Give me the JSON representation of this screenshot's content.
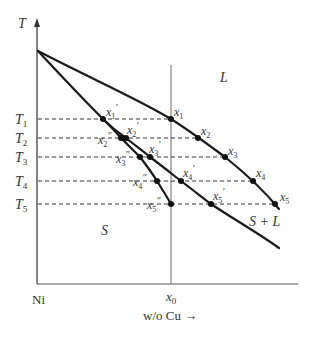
{
  "diagram": {
    "axes": {
      "y_label": "T",
      "x_origin_label": "Ni",
      "x_marker_label": "x",
      "x_marker_sub": "0",
      "x_axis_label": "w/o Cu →"
    },
    "regions": {
      "liquid": "L",
      "solid": "S",
      "two_phase": "S + L"
    },
    "temperatures": [
      {
        "label": "T",
        "sub": "1",
        "y": 119
      },
      {
        "label": "T",
        "sub": "2",
        "y": 138
      },
      {
        "label": "T",
        "sub": "3",
        "y": 157
      },
      {
        "label": "T",
        "sub": "4",
        "y": 181
      },
      {
        "label": "T",
        "sub": "5",
        "y": 204
      }
    ],
    "liquidus_points": [
      {
        "name": "x",
        "sub": "1",
        "prime": "",
        "x": 171,
        "y": 119
      },
      {
        "name": "x",
        "sub": "2",
        "prime": "",
        "x": 198,
        "y": 138
      },
      {
        "name": "x",
        "sub": "3",
        "prime": "",
        "x": 225,
        "y": 157
      },
      {
        "name": "x",
        "sub": "4",
        "prime": "",
        "x": 253,
        "y": 181
      },
      {
        "name": "x",
        "sub": "5",
        "prime": "",
        "x": 275,
        "y": 204
      }
    ],
    "solidus_points": [
      {
        "name": "x",
        "sub": "1",
        "prime": "′",
        "x": 103,
        "y": 119
      },
      {
        "name": "x",
        "sub": "2",
        "prime": "′",
        "x": 126,
        "y": 138
      },
      {
        "name": "x",
        "sub": "3",
        "prime": "′",
        "x": 150,
        "y": 157
      },
      {
        "name": "x",
        "sub": "4",
        "prime": "′",
        "x": 181,
        "y": 181
      },
      {
        "name": "x",
        "sub": "5",
        "prime": "′",
        "x": 211,
        "y": 204
      }
    ],
    "average_solid_points": [
      {
        "name": "x",
        "sub": "2",
        "prime": "″",
        "x": 121,
        "y": 138
      },
      {
        "name": "x",
        "sub": "3",
        "prime": "″",
        "x": 140,
        "y": 157
      },
      {
        "name": "x",
        "sub": "4",
        "prime": "″",
        "x": 157,
        "y": 181
      },
      {
        "name": "x",
        "sub": "5",
        "prime": "″",
        "x": 171,
        "y": 204
      }
    ],
    "colors": {
      "curve": "#1a1a1a",
      "axis": "#333333",
      "composition_line": "#8c8c8c",
      "dashed": "#333333"
    }
  }
}
